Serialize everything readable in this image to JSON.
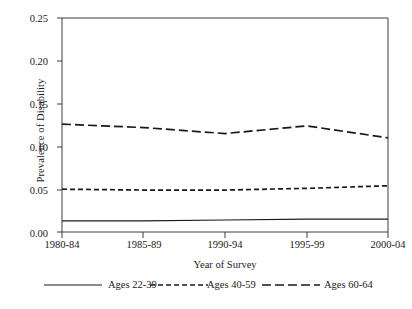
{
  "chart_data": {
    "type": "line",
    "title": "",
    "xlabel": "Year of Survey",
    "ylabel": "Prevalence of Disability",
    "categories": [
      "1980-84",
      "1985-89",
      "1990-94",
      "1995-99",
      "2000-04"
    ],
    "ylim": [
      0.0,
      0.25
    ],
    "yticks": [
      0.0,
      0.05,
      0.1,
      0.15,
      0.2,
      0.25
    ],
    "ytick_labels": [
      "0.00",
      "0.05",
      "0.10",
      "0.15",
      "0.20",
      "0.25"
    ],
    "grid": false,
    "legend_position": "below-axes",
    "series": [
      {
        "name": "Ages 22-39",
        "style": "solid",
        "values": [
          0.013,
          0.013,
          0.014,
          0.015,
          0.015
        ]
      },
      {
        "name": "Ages 40-59",
        "style": "dashed-short",
        "values": [
          0.05,
          0.049,
          0.049,
          0.051,
          0.054
        ]
      },
      {
        "name": "Ages 60-64",
        "style": "dashed-long",
        "values": [
          0.126,
          0.122,
          0.115,
          0.124,
          0.11
        ]
      }
    ]
  },
  "axes": {
    "y_tick_labels": [
      "0.25",
      "0.20",
      "0.15",
      "0.10",
      "0.05",
      "0.00"
    ],
    "x_tick_labels": [
      "1980-84",
      "1985-89",
      "1990-94",
      "1995-99",
      "2000-04"
    ],
    "y_axis_title": "Prevalence of Disability",
    "x_axis_title": "Year of Survey"
  },
  "legend": {
    "entries": [
      {
        "label": "Ages 22-39",
        "style": "solid"
      },
      {
        "label": "Ages 40-59",
        "style": "dashed-short"
      },
      {
        "label": "Ages 60-64",
        "style": "dashed-long"
      }
    ]
  },
  "colors": {
    "line": "#1a1a1a",
    "axis": "#3c3c3c",
    "background": "#ffffff"
  }
}
